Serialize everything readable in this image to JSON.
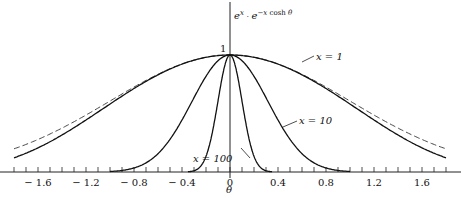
{
  "chart_data": {
    "type": "line",
    "title": "",
    "ylabel": "e^{x + e^{-x cosh θ}}",
    "ylabel_display": "e^x · e^{−x cosh θ}",
    "xlabel": "θ",
    "peak_label": "1",
    "x_ticks": [
      "-1.6",
      "-1.2",
      "-0.8",
      "-0.4",
      "0",
      "0.4",
      "0.8",
      "1.2",
      "1.6"
    ],
    "x_tick_values": [
      -1.6,
      -1.2,
      -0.8,
      -0.4,
      0,
      0.4,
      0.8,
      1.2,
      1.6
    ],
    "minor_tick_step": 0.1,
    "xlim": [
      -1.8,
      1.8
    ],
    "ylim": [
      0,
      1.05
    ],
    "grid": false,
    "series": [
      {
        "name": "x=1",
        "label": "x = 1",
        "style": "solid",
        "x": [
          -1.8,
          -1.2,
          -0.8,
          -0.4,
          0,
          0.4,
          0.8,
          1.2,
          1.8
        ],
        "values": [
          0.13,
          0.37,
          0.62,
          0.87,
          1.0,
          0.87,
          0.62,
          0.37,
          0.13
        ]
      },
      {
        "name": "x=1 gaussian approx",
        "label": "",
        "style": "dashed",
        "x": [
          -1.8,
          -1.2,
          -0.8,
          -0.4,
          0,
          0.4,
          0.8,
          1.2,
          1.8
        ],
        "values": [
          0.2,
          0.49,
          0.73,
          0.92,
          1.0,
          0.92,
          0.73,
          0.49,
          0.2
        ]
      },
      {
        "name": "x=10",
        "label": "x = 10",
        "style": "solid",
        "x": [
          -1.0,
          -0.8,
          -0.6,
          -0.4,
          -0.2,
          0,
          0.2,
          0.4,
          0.6,
          0.8,
          1.0
        ],
        "values": [
          0.0,
          0.04,
          0.17,
          0.45,
          0.82,
          1.0,
          0.82,
          0.45,
          0.17,
          0.04,
          0.0
        ]
      },
      {
        "name": "x=100",
        "label": "x = 100",
        "style": "solid",
        "x": [
          -0.35,
          -0.25,
          -0.15,
          -0.08,
          0,
          0.08,
          0.15,
          0.25,
          0.35
        ],
        "values": [
          0.0,
          0.04,
          0.33,
          0.73,
          1.0,
          0.73,
          0.33,
          0.04,
          0.0
        ]
      }
    ],
    "legend_position": "inline annotations"
  }
}
